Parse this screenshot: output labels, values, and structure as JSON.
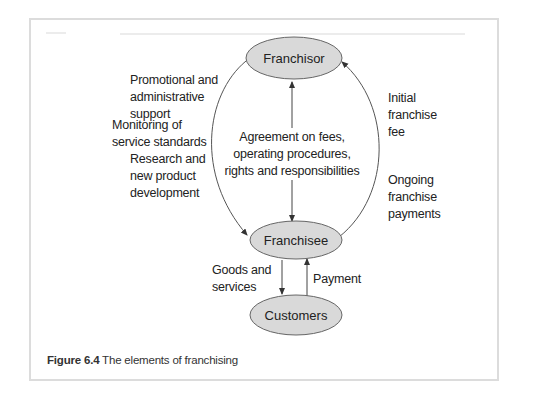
{
  "figure": {
    "caption_number": "Figure 6.4",
    "caption_text": " The elements of franchising"
  },
  "nodes": {
    "franchisor": "Franchisor",
    "franchisee": "Franchisee",
    "customers": "Customers"
  },
  "labels": {
    "left_top": [
      "Promotional and",
      "administrative",
      "support"
    ],
    "left_middle": [
      "Monitoring of",
      "service standards"
    ],
    "left_bottom": [
      "Research and",
      "new product",
      "development"
    ],
    "center": [
      "Agreement on fees,",
      "operating procedures,",
      "rights and responsibilities"
    ],
    "right_top": [
      "Initial",
      "franchise",
      "fee"
    ],
    "right_bottom": [
      "Ongoing",
      "franchise",
      "payments"
    ],
    "goods": [
      "Goods and",
      "services"
    ],
    "payment": [
      "Payment"
    ]
  },
  "colors": {
    "node_fill": "#d9d9d9",
    "node_stroke": "#666666",
    "line": "#444444",
    "frame": "#dcdcdc"
  }
}
